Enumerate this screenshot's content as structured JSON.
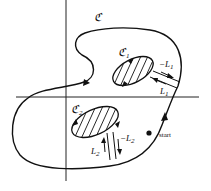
{
  "diagram": {
    "title": "",
    "outer_contour": {
      "label": "ℭ",
      "label_text": "C"
    },
    "holes": [
      {
        "id": "C1",
        "label": "ℭ",
        "subscript": "1",
        "cut_labels": [
          "−L",
          "L"
        ],
        "cut_subscript": "1"
      },
      {
        "id": "C2",
        "label": "ℭ",
        "subscript": "2",
        "cut_labels": [
          "−L",
          "L"
        ],
        "cut_subscript": "2"
      }
    ],
    "start_label": "start",
    "colors": {
      "stroke": "#111111",
      "background": "#ffffff"
    }
  }
}
